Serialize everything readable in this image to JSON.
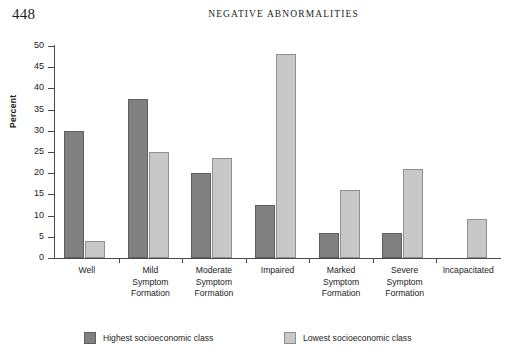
{
  "page": {
    "folio": "448",
    "running_head": "NEGATIVE  ABNORMALITIES"
  },
  "chart_data": {
    "type": "bar",
    "title": "",
    "xlabel": "",
    "ylabel": "Percent",
    "ylim": [
      0,
      50
    ],
    "yticks": [
      0,
      5,
      10,
      15,
      20,
      25,
      30,
      35,
      40,
      45,
      50
    ],
    "grid": false,
    "legend_position": "bottom",
    "categories": [
      "Well",
      "Mild Symptom Formation",
      "Moderate Symptom Formation",
      "Impaired",
      "Marked Symptom Formation",
      "Severe Symptom Formation",
      "Incapacitated"
    ],
    "category_lines": [
      [
        "Well"
      ],
      [
        "Mild",
        "Symptom",
        "Formation"
      ],
      [
        "Moderate",
        "Symptom",
        "Formation"
      ],
      [
        "Impaired"
      ],
      [
        "Marked",
        "Symptom",
        "Formation"
      ],
      [
        "Severe",
        "Symptom",
        "Formation"
      ],
      [
        "Incapacitated"
      ]
    ],
    "series": [
      {
        "name": "Highest socioeconomic class",
        "color": "#808080",
        "values": [
          30.0,
          37.5,
          20.0,
          12.5,
          6.0,
          6.0,
          0.0
        ]
      },
      {
        "name": "Lowest socioeconomic class",
        "color": "#c8c8c8",
        "values": [
          4.0,
          25.0,
          23.5,
          48.0,
          16.0,
          21.0,
          9.3
        ]
      }
    ]
  },
  "legend": {
    "items": [
      {
        "label": "Highest socioeconomic class",
        "swatch": "dark"
      },
      {
        "label": "Lowest socioeconomic class",
        "swatch": "light"
      }
    ]
  }
}
